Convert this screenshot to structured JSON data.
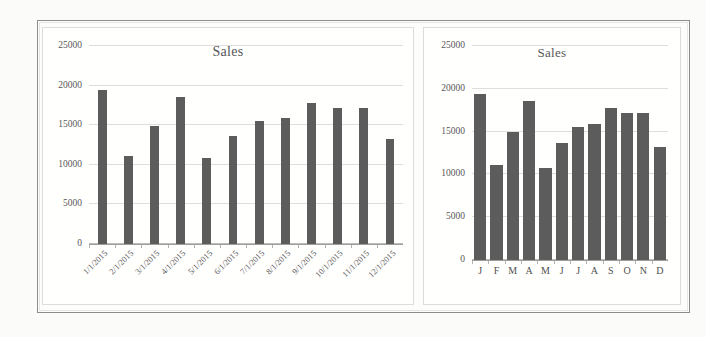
{
  "chart_data": [
    {
      "type": "bar",
      "panel": "left",
      "title": "Sales",
      "xlabel": "",
      "ylabel": "",
      "ylim": [
        0,
        25000
      ],
      "yticks": [
        0,
        5000,
        10000,
        15000,
        20000,
        25000
      ],
      "ytick_labels": [
        "0",
        "5000",
        "10000",
        "15000",
        "20000",
        "25000"
      ],
      "grid": true,
      "legend": "none",
      "axis_label_rotation": -45,
      "bar_style": "narrow-bars-wide-gaps",
      "categories": [
        "1/1/2015",
        "2/1/2015",
        "3/1/2015",
        "4/1/2015",
        "5/1/2015",
        "6/1/2015",
        "7/1/2015",
        "8/1/2015",
        "9/1/2015",
        "10/1/2015",
        "11/1/2015",
        "12/1/2015"
      ],
      "values": [
        19400,
        11100,
        14900,
        18600,
        10800,
        13700,
        15500,
        15900,
        17800,
        17200,
        17200,
        13200
      ],
      "bar_color": "#5c5c5c"
    },
    {
      "type": "bar",
      "panel": "right",
      "title": "Sales",
      "xlabel": "",
      "ylabel": "",
      "ylim": [
        0,
        25000
      ],
      "yticks": [
        0,
        5000,
        10000,
        15000,
        20000,
        25000
      ],
      "ytick_labels": [
        "0",
        "5000",
        "10000",
        "15000",
        "20000",
        "25000"
      ],
      "grid": true,
      "legend": "none",
      "axis_label_rotation": 0,
      "bar_style": "wide-bars-narrow-gaps",
      "categories": [
        "J",
        "F",
        "M",
        "A",
        "M",
        "J",
        "J",
        "A",
        "S",
        "O",
        "N",
        "D"
      ],
      "values": [
        19400,
        11100,
        14900,
        18600,
        10800,
        13700,
        15500,
        15900,
        17800,
        17200,
        17200,
        13200
      ],
      "bar_color": "#5c5c5c"
    }
  ]
}
